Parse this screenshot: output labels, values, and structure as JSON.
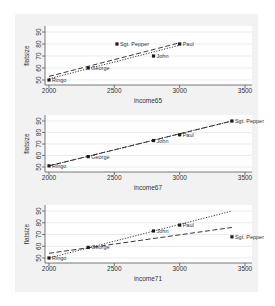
{
  "chart_data": [
    {
      "type": "scatter",
      "title": "",
      "xlabel": "income65",
      "ylabel": "flatsize",
      "xlim": [
        1950,
        3550
      ],
      "ylim": [
        46,
        94
      ],
      "xticks": [
        2000,
        2500,
        3000,
        3500
      ],
      "yticks": [
        50,
        60,
        70,
        80,
        90
      ],
      "grid": true,
      "points": [
        {
          "label": "Ringo",
          "x": 2000,
          "y": 50
        },
        {
          "label": "George",
          "x": 2300,
          "y": 60
        },
        {
          "label": "Sgt. Pepper",
          "x": 2520,
          "y": 80
        },
        {
          "label": "John",
          "x": 2800,
          "y": 70
        },
        {
          "label": "Paul",
          "x": 3000,
          "y": 80
        }
      ],
      "fit_lines": [
        {
          "name": "fit with Sgt. Pepper",
          "style": "dashed",
          "x": [
            2000,
            3000
          ],
          "y": [
            53,
            81
          ]
        },
        {
          "name": "fit without Sgt. Pepper",
          "style": "dotted",
          "x": [
            2000,
            3000
          ],
          "y": [
            51,
            79
          ]
        }
      ]
    },
    {
      "type": "scatter",
      "title": "",
      "xlabel": "income67",
      "ylabel": "flatsize",
      "xlim": [
        1950,
        3550
      ],
      "ylim": [
        46,
        94
      ],
      "xticks": [
        2000,
        2500,
        3000,
        3500
      ],
      "yticks": [
        50,
        60,
        70,
        80,
        90
      ],
      "grid": true,
      "points": [
        {
          "label": "Ringo",
          "x": 2000,
          "y": 51
        },
        {
          "label": "George",
          "x": 2300,
          "y": 59
        },
        {
          "label": "John",
          "x": 2800,
          "y": 73
        },
        {
          "label": "Paul",
          "x": 3000,
          "y": 78
        },
        {
          "label": "Sgt. Pepper",
          "x": 3400,
          "y": 90
        }
      ],
      "fit_lines": [
        {
          "name": "fit with Sgt. Pepper",
          "style": "dashed",
          "x": [
            2000,
            3400
          ],
          "y": [
            51,
            90
          ]
        },
        {
          "name": "fit without Sgt. Pepper",
          "style": "dotted",
          "x": [
            2000,
            3400
          ],
          "y": [
            51,
            90
          ]
        }
      ]
    },
    {
      "type": "scatter",
      "title": "",
      "xlabel": "income71",
      "ylabel": "flatsize",
      "xlim": [
        1950,
        3550
      ],
      "ylim": [
        46,
        94
      ],
      "xticks": [
        2000,
        2500,
        3000,
        3500
      ],
      "yticks": [
        50,
        60,
        70,
        80,
        90
      ],
      "grid": true,
      "points": [
        {
          "label": "Ringo",
          "x": 2000,
          "y": 50
        },
        {
          "label": "George",
          "x": 2300,
          "y": 59
        },
        {
          "label": "John",
          "x": 2800,
          "y": 73
        },
        {
          "label": "Paul",
          "x": 3000,
          "y": 78
        },
        {
          "label": "Sgt. Pepper",
          "x": 3400,
          "y": 68
        }
      ],
      "fit_lines": [
        {
          "name": "fit with Sgt. Pepper",
          "style": "dashed",
          "x": [
            2000,
            3400
          ],
          "y": [
            54,
            76
          ]
        },
        {
          "name": "fit without Sgt. Pepper",
          "style": "dotted",
          "x": [
            2000,
            3400
          ],
          "y": [
            50,
            90
          ]
        }
      ]
    }
  ],
  "panels": [
    {
      "xlabel": "income65",
      "ylabel": "flatsize"
    },
    {
      "xlabel": "income67",
      "ylabel": "flatsize"
    },
    {
      "xlabel": "income71",
      "ylabel": "flatsize"
    }
  ],
  "colors": {
    "outer_bg": "#f2f2f2",
    "plot_bg": "#ffffff",
    "grid": "#e6e6e6",
    "axis": "#555555",
    "marker": "#1a1a1a",
    "text": "#333333"
  }
}
